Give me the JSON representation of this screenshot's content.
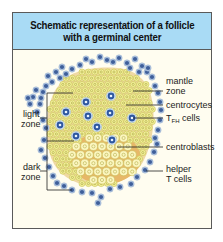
{
  "figure": {
    "title_line1": "Schematic representation of a follicle",
    "title_line2": "with a germinal center"
  },
  "colors": {
    "header_bg": "#a9dbf5",
    "panel_bg": "#fffdf0",
    "border": "#5a5a5a",
    "germinal_center_bg": "#efd9a3",
    "dark_zone_bg": "#e7b868",
    "centrocyte_fill": "#f2ef9a",
    "centrocyte_ring": "#c8c250",
    "centroblast_fill": "#fbf6c0",
    "lymphocyte_outer": "#aec4e0",
    "lymphocyte_nucleus": "#3f5f9a",
    "tfh_halo": "#dfeefb",
    "tfh_nucleus": "#2f58a0"
  },
  "labels": {
    "right": [
      {
        "id": "mantle-zone",
        "lines": [
          "mantle",
          "zone"
        ],
        "line_y": 93,
        "text_y": 87
      },
      {
        "id": "centrocytes",
        "lines": [
          "centrocytes"
        ],
        "line_y": 108,
        "text_y": 111
      },
      {
        "id": "tfh-cells",
        "lines": [
          "T",
          "FH",
          " cells"
        ],
        "line_y": 125,
        "text_y": 128
      },
      {
        "id": "centroblasts",
        "lines": [
          "centroblasts"
        ],
        "line_y": 146,
        "text_y": 149
      },
      {
        "id": "helper-t-cells",
        "lines": [
          "helper",
          "T cells"
        ],
        "line_y": 170,
        "text_y": 168
      }
    ],
    "left": [
      {
        "id": "light-zone",
        "lines": [
          "light",
          "zone"
        ],
        "text_y": 115
      },
      {
        "id": "dark-zone",
        "lines": [
          "dark",
          "zone"
        ],
        "text_y": 169
      }
    ]
  },
  "labels_text": {
    "mantle_zone_1": "mantle",
    "mantle_zone_2": "zone",
    "centrocytes": "centrocytes",
    "tfh_T": "T",
    "tfh_sub": "FH",
    "tfh_cells": " cells",
    "centroblasts": "centroblasts",
    "helper_1": "helper",
    "helper_2": "T cells",
    "light_1": "light",
    "light_2": "zone",
    "dark_1": "dark",
    "dark_2": "zone"
  },
  "cells": {
    "tfh": [
      [
        86,
        102
      ],
      [
        111,
        96
      ],
      [
        66,
        112
      ],
      [
        88,
        116
      ],
      [
        110,
        113
      ],
      [
        132,
        118
      ],
      [
        97,
        127
      ],
      [
        76,
        136
      ],
      [
        112,
        140
      ],
      [
        60,
        125
      ]
    ],
    "mantle": [
      [
        100,
        57
      ],
      [
        107,
        60
      ],
      [
        119,
        58
      ],
      [
        127,
        63
      ],
      [
        135,
        59
      ],
      [
        130,
        68
      ],
      [
        92,
        62
      ],
      [
        80,
        65
      ],
      [
        72,
        69
      ],
      [
        66,
        74
      ],
      [
        60,
        78
      ],
      [
        52,
        82
      ],
      [
        46,
        86
      ],
      [
        43,
        92
      ],
      [
        36,
        90
      ],
      [
        33,
        97
      ],
      [
        28,
        98
      ],
      [
        41,
        98
      ],
      [
        56,
        72
      ],
      [
        62,
        67
      ],
      [
        48,
        76
      ],
      [
        142,
        66
      ],
      [
        147,
        72
      ],
      [
        152,
        77
      ],
      [
        155,
        86
      ],
      [
        158,
        93
      ],
      [
        160,
        102
      ],
      [
        161,
        110
      ],
      [
        160,
        120
      ],
      [
        158,
        130
      ],
      [
        155,
        138
      ],
      [
        148,
        68
      ],
      [
        139,
        72
      ],
      [
        113,
        62
      ],
      [
        86,
        59
      ],
      [
        40,
        104
      ],
      [
        37,
        112
      ],
      [
        43,
        120
      ],
      [
        46,
        128
      ],
      [
        44,
        140
      ],
      [
        41,
        150
      ],
      [
        45,
        158
      ],
      [
        49,
        167
      ],
      [
        53,
        176
      ],
      [
        57,
        183
      ],
      [
        64,
        186
      ],
      [
        72,
        190
      ],
      [
        82,
        192
      ],
      [
        92,
        193
      ],
      [
        101,
        197
      ],
      [
        98,
        203
      ],
      [
        110,
        189
      ],
      [
        120,
        187
      ],
      [
        131,
        184
      ],
      [
        137,
        177
      ],
      [
        145,
        170
      ],
      [
        150,
        162
      ],
      [
        154,
        152
      ],
      [
        157,
        144
      ],
      [
        30,
        104
      ]
    ]
  }
}
